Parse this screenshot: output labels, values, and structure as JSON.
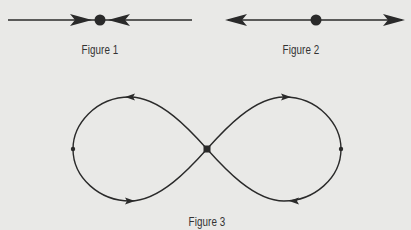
{
  "figures": [
    {
      "id": "figure-1",
      "label": "Figure 1",
      "description": "Stable equilibrium point on a line: arrows point inward toward the dot",
      "label_pos": [
        100,
        51
      ]
    },
    {
      "id": "figure-2",
      "label": "Figure 2",
      "description": "Unstable equilibrium point on a line: arrows point outward away from the dot",
      "label_pos": [
        301,
        51
      ]
    },
    {
      "id": "figure-3",
      "label": "Figure 3",
      "description": "Figure-eight phase portrait with a saddle point at the center and orbits circulating around both lobes",
      "label_pos": [
        207,
        224
      ]
    }
  ],
  "colors": {
    "background": "#e9e9e7",
    "ink": "#2a2a2a"
  }
}
